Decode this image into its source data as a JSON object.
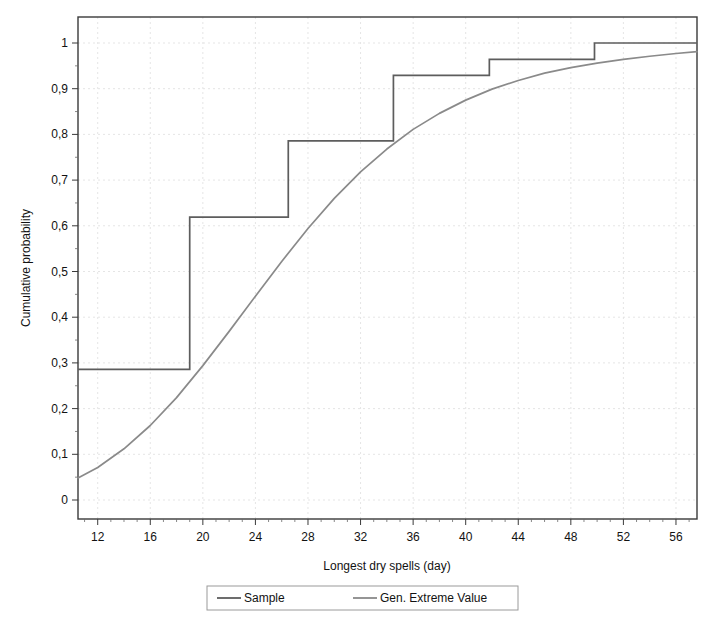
{
  "chart_data": {
    "type": "line",
    "title": "",
    "xlabel": "Longest dry spells (day)",
    "ylabel": "Cumulative probability",
    "xlim": [
      10.5,
      57.6
    ],
    "ylim": [
      0,
      1.02
    ],
    "grid": true,
    "legend_position": "bottom-outside",
    "xticks": [
      12,
      16,
      20,
      24,
      28,
      32,
      36,
      40,
      44,
      48,
      52,
      56
    ],
    "xtick_labels": [
      "12",
      "16",
      "20",
      "24",
      "28",
      "32",
      "36",
      "40",
      "44",
      "48",
      "52",
      "56"
    ],
    "yticks": [
      0,
      0.1,
      0.2,
      0.3,
      0.4,
      0.5,
      0.6,
      0.7,
      0.8,
      0.9,
      1
    ],
    "ytick_labels": [
      "0",
      "0,1",
      "0,2",
      "0,3",
      "0,4",
      "0,5",
      "0,6",
      "0,7",
      "0,8",
      "0,9",
      "1"
    ],
    "decimal_separator": ",",
    "series": [
      {
        "name": "Sample",
        "type": "step",
        "step_mode": "post",
        "color": "#5d5d5d",
        "x": [
          10.5,
          19.0,
          26.5,
          34.5,
          41.8,
          49.8,
          57.6
        ],
        "y": [
          0.286,
          0.619,
          0.786,
          0.929,
          0.964,
          1.0,
          1.0
        ]
      },
      {
        "name": "Gen. Extreme Value",
        "type": "line",
        "color": "#8a8a8a",
        "x": [
          10.5,
          12,
          14,
          16,
          18,
          20,
          22,
          24,
          26,
          28,
          30,
          32,
          34,
          36,
          38,
          40,
          42,
          44,
          46,
          48,
          50,
          52,
          54,
          56,
          57.6
        ],
        "y": [
          0.048,
          0.071,
          0.112,
          0.163,
          0.224,
          0.294,
          0.369,
          0.446,
          0.522,
          0.594,
          0.66,
          0.718,
          0.768,
          0.811,
          0.846,
          0.875,
          0.899,
          0.918,
          0.934,
          0.946,
          0.956,
          0.964,
          0.971,
          0.977,
          0.981
        ]
      }
    ]
  },
  "legend": {
    "entries": [
      {
        "label": "Sample",
        "color": "#5d5d5d"
      },
      {
        "label": "Gen. Extreme Value",
        "color": "#8a8a8a"
      }
    ]
  },
  "axes": {
    "x_title": "Longest dry spells (day)",
    "y_title": "Cumulative probability"
  }
}
